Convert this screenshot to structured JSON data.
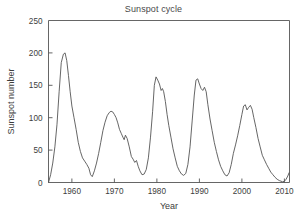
{
  "chart_data": {
    "type": "line",
    "title": "Sunspot cycle",
    "xlabel": "Year",
    "ylabel": "Sunspot number",
    "xlim": [
      1954.5,
      2011.2
    ],
    "ylim": [
      0,
      250
    ],
    "xticks": [
      1960,
      1970,
      1980,
      1990,
      2000,
      2010
    ],
    "xtick_labels": [
      "1960",
      "1970",
      "1980",
      "1990",
      "2000",
      "2010"
    ],
    "yticks": [
      0,
      50,
      100,
      150,
      200,
      250
    ],
    "ytick_labels": [
      "0",
      "50",
      "100",
      "150",
      "200",
      "250"
    ],
    "grid": false,
    "legend": null,
    "line_color": "#555555",
    "series": [
      {
        "name": "Sunspot number",
        "x": [
          1954.5,
          1955.0,
          1955.5,
          1956.0,
          1956.5,
          1957.0,
          1957.5,
          1958.0,
          1958.4,
          1958.8,
          1959.2,
          1959.6,
          1960.0,
          1960.5,
          1961.0,
          1961.5,
          1962.0,
          1962.5,
          1963.0,
          1963.5,
          1964.0,
          1964.4,
          1964.8,
          1965.3,
          1965.8,
          1966.3,
          1966.8,
          1967.3,
          1967.8,
          1968.3,
          1968.8,
          1969.2,
          1969.6,
          1970.0,
          1970.4,
          1970.8,
          1971.2,
          1971.6,
          1972.0,
          1972.3,
          1972.6,
          1973.0,
          1973.5,
          1974.0,
          1974.4,
          1974.8,
          1975.2,
          1975.6,
          1976.0,
          1976.5,
          1977.0,
          1977.5,
          1978.0,
          1978.5,
          1979.0,
          1979.4,
          1979.8,
          1980.2,
          1980.6,
          1981.0,
          1981.3,
          1981.6,
          1982.0,
          1982.4,
          1982.8,
          1983.3,
          1983.8,
          1984.3,
          1984.8,
          1985.3,
          1985.8,
          1986.3,
          1986.8,
          1987.3,
          1987.8,
          1988.3,
          1988.8,
          1989.2,
          1989.6,
          1990.0,
          1990.4,
          1990.8,
          1991.2,
          1991.6,
          1992.0,
          1992.5,
          1993.0,
          1993.5,
          1994.0,
          1994.5,
          1995.0,
          1995.5,
          1996.0,
          1996.5,
          1997.0,
          1997.5,
          1998.0,
          1998.5,
          1999.0,
          1999.5,
          2000.0,
          2000.4,
          2000.8,
          2001.2,
          2001.6,
          2002.0,
          2002.4,
          2002.8,
          2003.3,
          2003.8,
          2004.3,
          2004.8,
          2005.3,
          2005.8,
          2006.3,
          2006.8,
          2007.3,
          2007.8,
          2008.3,
          2008.8,
          2009.2,
          2009.6,
          2010.0,
          2010.4,
          2010.8,
          2011.1
        ],
        "values": [
          0,
          12,
          30,
          55,
          90,
          140,
          185,
          198,
          200,
          188,
          165,
          140,
          118,
          100,
          82,
          62,
          48,
          38,
          33,
          28,
          22,
          12,
          9,
          18,
          30,
          45,
          62,
          80,
          93,
          103,
          108,
          110,
          109,
          105,
          100,
          92,
          82,
          76,
          70,
          66,
          73,
          68,
          55,
          40,
          36,
          31,
          34,
          25,
          18,
          12,
          13,
          20,
          38,
          70,
          110,
          150,
          163,
          158,
          152,
          142,
          145,
          140,
          125,
          105,
          88,
          70,
          52,
          38,
          25,
          18,
          13,
          11,
          14,
          28,
          55,
          95,
          135,
          158,
          160,
          152,
          145,
          142,
          147,
          140,
          120,
          98,
          80,
          62,
          48,
          35,
          25,
          18,
          12,
          10,
          15,
          28,
          45,
          58,
          72,
          88,
          105,
          118,
          120,
          112,
          116,
          119,
          113,
          100,
          85,
          68,
          55,
          42,
          35,
          28,
          22,
          16,
          12,
          8,
          5,
          3,
          2,
          1,
          2,
          5,
          10,
          15
        ]
      }
    ]
  }
}
